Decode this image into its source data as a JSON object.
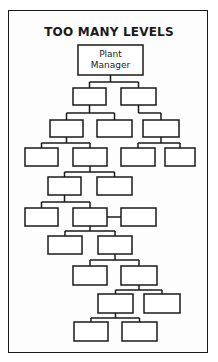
{
  "title": "TOO MANY LEVELS",
  "root": {
    "id": "plant-manager",
    "label_lines": [
      "Plant",
      "Manager"
    ]
  },
  "nodes": [
    {
      "id": "plant-manager",
      "level": 1,
      "label_lines": [
        "Plant",
        "Manager"
      ],
      "parent": null
    },
    {
      "id": "n2a",
      "level": 2,
      "parent": "plant-manager",
      "label_lines": []
    },
    {
      "id": "n2b",
      "level": 2,
      "parent": "plant-manager",
      "label_lines": []
    },
    {
      "id": "n3a",
      "level": 3,
      "parent": "n2a",
      "label_lines": []
    },
    {
      "id": "n3b",
      "level": 3,
      "parent": "n2a",
      "label_lines": []
    },
    {
      "id": "n3c",
      "level": 3,
      "parent": "n2b",
      "label_lines": []
    },
    {
      "id": "n4a",
      "level": 4,
      "parent": "n3a",
      "label_lines": []
    },
    {
      "id": "n4b",
      "level": 4,
      "parent": "n3a",
      "label_lines": []
    },
    {
      "id": "n4c",
      "level": 4,
      "parent": "n3c",
      "label_lines": []
    },
    {
      "id": "n4d",
      "level": 4,
      "parent": "n3c",
      "label_lines": []
    },
    {
      "id": "n5a",
      "level": 5,
      "parent": "n4b",
      "label_lines": []
    },
    {
      "id": "n5b",
      "level": 5,
      "parent": "n4b",
      "label_lines": []
    },
    {
      "id": "n6a",
      "level": 6,
      "parent": "n5a",
      "label_lines": []
    },
    {
      "id": "n6b",
      "level": 6,
      "parent": "n5a",
      "label_lines": []
    },
    {
      "id": "n6c",
      "level": 6,
      "parent": "n6b",
      "label_lines": [],
      "side_link": true
    },
    {
      "id": "n7a",
      "level": 7,
      "parent": "n6b",
      "label_lines": []
    },
    {
      "id": "n7b",
      "level": 7,
      "parent": "n6b",
      "label_lines": []
    },
    {
      "id": "n8a",
      "level": 8,
      "parent": "n7b",
      "label_lines": []
    },
    {
      "id": "n8b",
      "level": 8,
      "parent": "n7b",
      "label_lines": []
    },
    {
      "id": "n9a",
      "level": 9,
      "parent": "n8b",
      "label_lines": []
    },
    {
      "id": "n9b",
      "level": 9,
      "parent": "n8b",
      "label_lines": []
    },
    {
      "id": "n10a",
      "level": 10,
      "parent": "n9a",
      "label_lines": []
    },
    {
      "id": "n10b",
      "level": 10,
      "parent": "n9a",
      "label_lines": []
    }
  ],
  "colors": {
    "ink": "#1a1a1a",
    "paper": "#ffffff"
  }
}
